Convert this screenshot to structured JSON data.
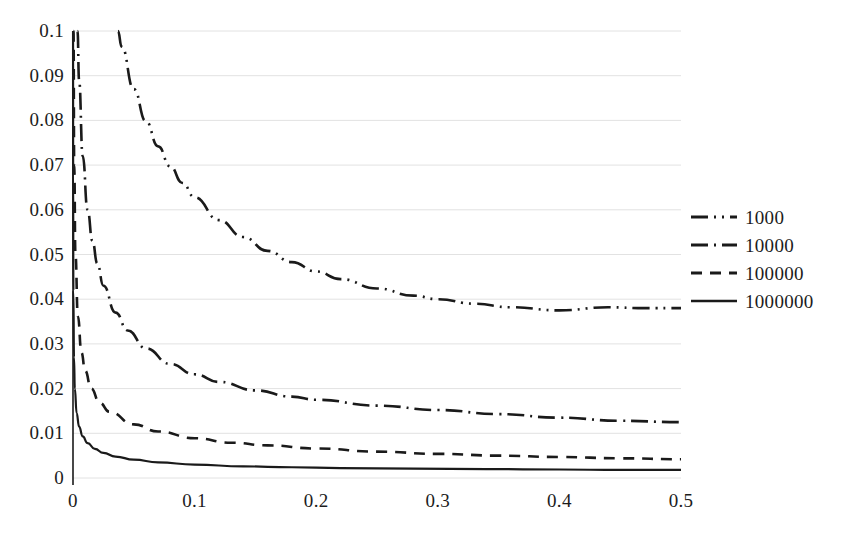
{
  "chart_data": {
    "type": "line",
    "title": "",
    "subtitle": "",
    "xlabel": "",
    "ylabel": "",
    "xlim": [
      0,
      0.5
    ],
    "ylim": [
      0,
      0.1
    ],
    "grid": true,
    "grid_axis": "y",
    "legend_position": "right",
    "x_ticks": [
      "0",
      "0.1",
      "0.2",
      "0.3",
      "0.4",
      "0.5"
    ],
    "x_tick_values": [
      0,
      0.1,
      0.2,
      0.3,
      0.4,
      0.5
    ],
    "y_ticks": [
      "0",
      "0.01",
      "0.02",
      "0.03",
      "0.04",
      "0.05",
      "0.06",
      "0.07",
      "0.08",
      "0.09",
      "0.1"
    ],
    "y_tick_values": [
      0,
      0.01,
      0.02,
      0.03,
      0.04,
      0.05,
      0.06,
      0.07,
      0.08,
      0.09,
      0.1
    ],
    "series": [
      {
        "name": "1000",
        "dash_style": "dash-dot-dot",
        "color": "#1a1a1a",
        "x": [
          0.037,
          0.04,
          0.05,
          0.06,
          0.07,
          0.08,
          0.09,
          0.1,
          0.12,
          0.14,
          0.16,
          0.18,
          0.2,
          0.22,
          0.25,
          0.28,
          0.3,
          0.33,
          0.36,
          0.4,
          0.44,
          0.47,
          0.5
        ],
        "values": [
          0.1,
          0.0965,
          0.087,
          0.0798,
          0.0742,
          0.0697,
          0.066,
          0.0628,
          0.0577,
          0.0539,
          0.0508,
          0.0483,
          0.0462,
          0.0445,
          0.0424,
          0.0408,
          0.04,
          0.039,
          0.0382,
          0.0375,
          0.0382,
          0.038,
          0.038
        ]
      },
      {
        "name": "10000",
        "dash_style": "dash-dot",
        "color": "#1a1a1a",
        "x": [
          0.0037,
          0.005,
          0.008,
          0.012,
          0.016,
          0.02,
          0.025,
          0.035,
          0.045,
          0.06,
          0.08,
          0.1,
          0.12,
          0.15,
          0.18,
          0.2,
          0.25,
          0.3,
          0.35,
          0.4,
          0.45,
          0.5
        ],
        "values": [
          0.1,
          0.089,
          0.072,
          0.06,
          0.053,
          0.048,
          0.043,
          0.037,
          0.033,
          0.029,
          0.0255,
          0.0232,
          0.0215,
          0.0196,
          0.0182,
          0.0175,
          0.0162,
          0.0152,
          0.0143,
          0.0135,
          0.0128,
          0.0125
        ]
      },
      {
        "name": "100000",
        "dash_style": "dashed",
        "color": "#1a1a1a",
        "x": [
          0.0004,
          0.001,
          0.002,
          0.004,
          0.007,
          0.01,
          0.015,
          0.022,
          0.03,
          0.05,
          0.07,
          0.1,
          0.13,
          0.16,
          0.2,
          0.25,
          0.3,
          0.35,
          0.4,
          0.45,
          0.5
        ],
        "values": [
          0.1,
          0.07,
          0.05,
          0.0362,
          0.028,
          0.024,
          0.02,
          0.0168,
          0.0148,
          0.012,
          0.0104,
          0.0089,
          0.0079,
          0.0073,
          0.0066,
          0.0059,
          0.0054,
          0.005,
          0.0047,
          0.0044,
          0.0042
        ]
      },
      {
        "name": "1000000",
        "dash_style": "solid",
        "color": "#1a1a1a",
        "x": [
          4e-05,
          0.0001,
          0.0003,
          0.0008,
          0.0015,
          0.003,
          0.005,
          0.008,
          0.012,
          0.018,
          0.025,
          0.035,
          0.05,
          0.07,
          0.1,
          0.14,
          0.18,
          0.22,
          0.28,
          0.34,
          0.4,
          0.45,
          0.5
        ],
        "values": [
          0.1,
          0.07,
          0.042,
          0.027,
          0.02,
          0.0145,
          0.0115,
          0.0093,
          0.0078,
          0.0065,
          0.0056,
          0.0048,
          0.0041,
          0.0035,
          0.003,
          0.0026,
          0.0024,
          0.0022,
          0.0021,
          0.002,
          0.0019,
          0.0018,
          0.0018
        ]
      }
    ]
  },
  "legend": {
    "entries": [
      {
        "label": "1000"
      },
      {
        "label": "10000"
      },
      {
        "label": "100000"
      },
      {
        "label": "1000000"
      }
    ]
  },
  "axes": {
    "y_labels": [
      "0.1",
      "0.09",
      "0.08",
      "0.07",
      "0.06",
      "0.05",
      "0.04",
      "0.03",
      "0.02",
      "0.01",
      "0"
    ],
    "x_labels": [
      "0",
      "0.1",
      "0.2",
      "0.3",
      "0.4",
      "0.5"
    ]
  },
  "colors": {
    "ink": "#1a1a1a",
    "grid": "#e2e2e2",
    "background": "#ffffff"
  }
}
